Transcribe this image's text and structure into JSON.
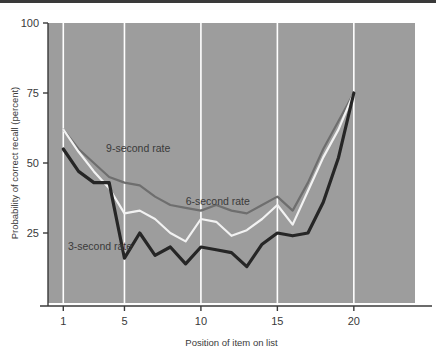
{
  "chart_data": {
    "type": "line",
    "title": "",
    "xlabel": "Position of item on list",
    "ylabel": "Probability of correct recall (percent)",
    "xlim": [
      0,
      24
    ],
    "ylim": [
      0,
      100
    ],
    "xticks": [
      1,
      5,
      10,
      15,
      20
    ],
    "yticks": [
      25,
      50,
      75,
      100
    ],
    "grid": "vertical white gridlines at x = 1, 5, 10, 15, 20",
    "legend_position": "inline annotations on plot",
    "plot_background": "#9d9d9d",
    "x": [
      1,
      2,
      3,
      4,
      5,
      6,
      7,
      8,
      9,
      10,
      11,
      12,
      13,
      14,
      15,
      16,
      17,
      18,
      19,
      20
    ],
    "series": [
      {
        "name": "3-second rate",
        "color": "#262626",
        "width": 3.2,
        "values": [
          55,
          47,
          43,
          43,
          16,
          25,
          17,
          20,
          14,
          20,
          19,
          18,
          13,
          21,
          25,
          24,
          25,
          36,
          52,
          75
        ]
      },
      {
        "name": "6-second rate",
        "color": "#f2f2f2",
        "width": 2.2,
        "values": [
          62,
          54,
          47,
          41,
          32,
          33,
          30,
          25,
          22,
          30,
          29,
          24,
          26,
          30,
          35,
          28,
          40,
          52,
          62,
          75
        ]
      },
      {
        "name": "9-second rate",
        "color": "#6e6e6e",
        "width": 2.2,
        "values": [
          62,
          55,
          50,
          45,
          43,
          42,
          38,
          35,
          34,
          33,
          35,
          33,
          32,
          35,
          38,
          33,
          43,
          55,
          65,
          75
        ]
      }
    ],
    "annotations": [
      {
        "text": "9-second rate",
        "x": 3.8,
        "y": 54
      },
      {
        "text": "6-second rate",
        "x": 9.0,
        "y": 35
      },
      {
        "text": "3-second rate",
        "x": 1.3,
        "y": 19
      }
    ]
  },
  "axis": {
    "y_tick_labels": [
      "100",
      "75",
      "50",
      "25"
    ],
    "x_tick_labels": [
      "1",
      "5",
      "10",
      "15",
      "20"
    ],
    "y_title": "Probability of correct recall (percent)",
    "x_title": "Position of item on list"
  },
  "labels": {
    "nine": "9-second rate",
    "six": "6-second rate",
    "three": "3-second rate"
  }
}
